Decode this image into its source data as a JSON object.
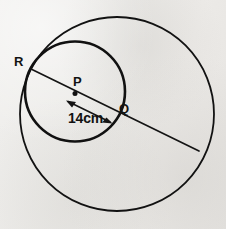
{
  "figure": {
    "kind": "geometry-diagram",
    "background_color": "#ecebe8",
    "ink_color": "#111111",
    "labels": {
      "r": "R",
      "p": "P",
      "q": "Q",
      "dimension": "14cm"
    },
    "shapes": {
      "outer_circle": {
        "name": "outer-circle",
        "cx": 117,
        "cy": 114,
        "r": 97,
        "stroke": "#111111",
        "stroke_width": 1.7
      },
      "inner_circle": {
        "name": "inner-circle",
        "cx": 75,
        "cy": 91.5,
        "r": 50,
        "stroke": "#111111",
        "stroke_width": 2.4
      }
    },
    "line_rq": {
      "name": "line-r-q",
      "x1": 31,
      "y1": 69,
      "x2": 199,
      "y2": 151,
      "stroke": "#111111",
      "stroke_width": 1.6
    },
    "center_dot": {
      "name": "center-point-p",
      "cx": 75,
      "cy": 93,
      "r": 2.4
    },
    "dimension_arrow": {
      "name": "dimension-arrow-pq",
      "x1": 66,
      "y1": 100,
      "x2": 112,
      "y2": 122,
      "stroke": "#111111",
      "stroke_width": 1.5
    }
  }
}
